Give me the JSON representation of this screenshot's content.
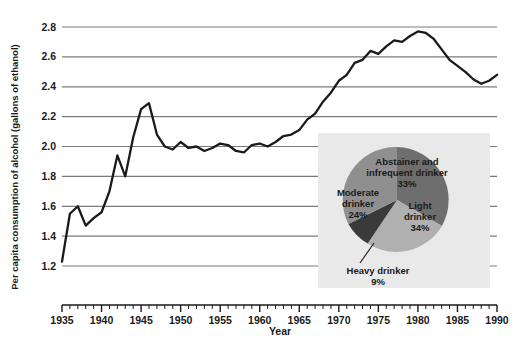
{
  "chart_data": [
    {
      "type": "line",
      "title": "",
      "xlabel": "Year",
      "ylabel": "Per capita consumption of alcohol (gallons of ethanol)",
      "xlim": [
        1935,
        1990
      ],
      "ylim": [
        1.2,
        2.8
      ],
      "grid": true,
      "legend": "none",
      "xticks": [
        1935,
        1940,
        1945,
        1950,
        1955,
        1960,
        1965,
        1970,
        1975,
        1980,
        1985,
        1990
      ],
      "xtick_labels": [
        "1935",
        "1940",
        "1945",
        "1950",
        "1955",
        "1960",
        "1965",
        "1970",
        "1975",
        "1980",
        "1985",
        "1990"
      ],
      "yticks": [
        1.2,
        1.4,
        1.6,
        1.8,
        2.0,
        2.2,
        2.4,
        2.6,
        2.8
      ],
      "ytick_labels": [
        "1.2",
        "1.4",
        "1.6",
        "1.8",
        "2.0",
        "2.2",
        "2.4",
        "2.6",
        "2.8"
      ],
      "x": [
        1935,
        1936,
        1937,
        1938,
        1939,
        1940,
        1941,
        1942,
        1943,
        1944,
        1945,
        1946,
        1947,
        1948,
        1949,
        1950,
        1951,
        1952,
        1953,
        1954,
        1955,
        1956,
        1957,
        1958,
        1959,
        1960,
        1961,
        1962,
        1963,
        1964,
        1965,
        1966,
        1967,
        1968,
        1969,
        1970,
        1971,
        1972,
        1973,
        1974,
        1975,
        1976,
        1977,
        1978,
        1979,
        1980,
        1981,
        1982,
        1983,
        1984,
        1985,
        1986,
        1987,
        1988,
        1989,
        1990
      ],
      "values": [
        1.23,
        1.55,
        1.6,
        1.47,
        1.52,
        1.56,
        1.7,
        1.94,
        1.8,
        2.06,
        2.25,
        2.29,
        2.08,
        2.0,
        1.98,
        2.03,
        1.99,
        2.0,
        1.97,
        1.99,
        2.02,
        2.01,
        1.97,
        1.96,
        2.01,
        2.02,
        2.0,
        2.03,
        2.07,
        2.08,
        2.11,
        2.18,
        2.22,
        2.3,
        2.36,
        2.44,
        2.48,
        2.56,
        2.58,
        2.64,
        2.62,
        2.67,
        2.71,
        2.7,
        2.74,
        2.77,
        2.76,
        2.72,
        2.65,
        2.58,
        2.54,
        2.5,
        2.45,
        2.42,
        2.44,
        2.48
      ],
      "series_color": "#1a1a1a",
      "grid_color": "#808080"
    },
    {
      "type": "pie",
      "title": "",
      "inset": true,
      "panel_color": "#e8e8e8",
      "categories": [
        "Abstainer and infrequent drinker",
        "Light drinker",
        "Moderate drinker",
        "Heavy drinker"
      ],
      "values": [
        33,
        34,
        24,
        9
      ],
      "value_labels": [
        "33%",
        "34%",
        "24%",
        "9%"
      ],
      "label_lines": [
        [
          "Abstainer and",
          "infrequent drinker",
          "33%"
        ],
        [
          "Light",
          "drinker",
          "34%"
        ],
        [
          "Moderate",
          "drinker",
          "24%"
        ],
        [
          "Heavy drinker",
          "9%"
        ]
      ],
      "colors": [
        "#6e6e6e",
        "#b0b0b0",
        "#8f8f8f",
        "#3a3a3a"
      ],
      "callout_slice": "Heavy drinker"
    }
  ],
  "axes": {
    "y_title": "Per capita consumption of alcohol (gallons of ethanol)",
    "x_title": "Year"
  }
}
